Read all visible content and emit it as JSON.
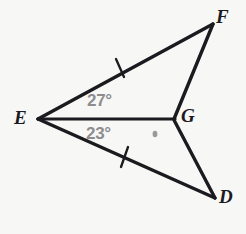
{
  "figure": {
    "kind": "geometry-diagram",
    "background_color": "#f7f7f6",
    "stroke_color": "#1b1b1f",
    "angle_text_color": "#8d8d8f",
    "vertices": [
      {
        "id": "E",
        "label": "E",
        "x": 38,
        "y": 119
      },
      {
        "id": "F",
        "label": "F",
        "x": 213,
        "y": 24
      },
      {
        "id": "G",
        "label": "G",
        "x": 174,
        "y": 119
      },
      {
        "id": "D",
        "label": "D",
        "x": 215,
        "y": 198
      }
    ],
    "segments": [
      {
        "id": "EF",
        "from": "E",
        "to": "F",
        "tick_marks": 1
      },
      {
        "id": "FG",
        "from": "F",
        "to": "G",
        "tick_marks": 0
      },
      {
        "id": "EG",
        "from": "E",
        "to": "G",
        "tick_marks": 0
      },
      {
        "id": "ED",
        "from": "E",
        "to": "D",
        "tick_marks": 1
      },
      {
        "id": "GD",
        "from": "G",
        "to": "D",
        "tick_marks": 0
      }
    ],
    "angles": [
      {
        "id": "FEG",
        "label": "27°",
        "value": 27,
        "unit": "degrees",
        "at": "E",
        "region": "upper"
      },
      {
        "id": "GED",
        "label": "23°",
        "value": 23,
        "unit": "degrees",
        "at": "E",
        "region": "lower"
      }
    ],
    "marks": [
      {
        "id": "interior-dot",
        "kind": "dot",
        "x": 155,
        "y": 134
      },
      {
        "id": "tick-EF",
        "kind": "congruence-tick",
        "x": 120,
        "y": 68
      },
      {
        "id": "tick-ED",
        "kind": "congruence-tick",
        "x": 125,
        "y": 157
      }
    ]
  }
}
